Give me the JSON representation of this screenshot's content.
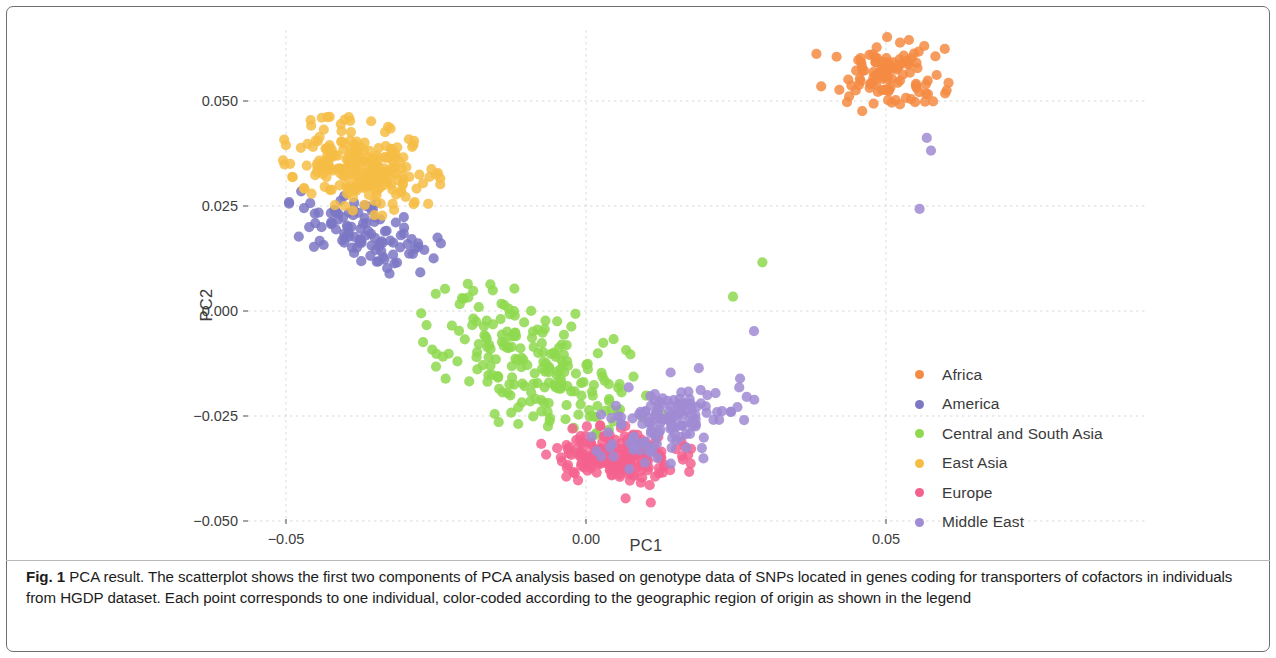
{
  "figure": {
    "caption_bold": "Fig. 1",
    "caption_text": " PCA result. The scatterplot shows the first two components of PCA analysis based on genotype data of SNPs located in genes coding for transporters of cofactors in individuals from HGDP dataset. Each point corresponds to one individual, color-coded according to the geographic region of origin as shown in the legend"
  },
  "chart_data": {
    "type": "scatter",
    "title": "",
    "xlabel": "PC1",
    "ylabel": "PC2",
    "xlim": [
      -0.056,
      0.068
    ],
    "ylim": [
      -0.056,
      0.066
    ],
    "xticks": [
      -0.05,
      0.0,
      0.05
    ],
    "xtick_labels": [
      "−0.05",
      "0.00",
      "0.05"
    ],
    "yticks": [
      0.05,
      0.025,
      0.0,
      -0.025,
      -0.05
    ],
    "ytick_labels": [
      "0.050",
      "0.025",
      "0.000",
      "−0.025",
      "−0.050"
    ],
    "grid": true,
    "grid_color": "#d9d9d9",
    "legend_position": "right",
    "marker_size": 8,
    "marker_opacity": 0.85,
    "series": [
      {
        "name": "Africa",
        "color": "#f58b43",
        "n": 105,
        "center": [
          0.0505,
          0.0555
        ],
        "spread": [
          0.0042,
          0.004
        ],
        "rotation": -0.55,
        "seed": 11
      },
      {
        "name": "America",
        "color": "#7b77c4",
        "n": 105,
        "center": [
          -0.0368,
          0.0185
        ],
        "spread": [
          0.0062,
          0.0036
        ],
        "rotation": -0.62,
        "seed": 23
      },
      {
        "name": "Central and South Asia",
        "color": "#8ed94f",
        "n": 210,
        "center": [
          -0.0075,
          -0.014
        ],
        "spread": [
          0.0105,
          0.0058
        ],
        "rotation": -0.8,
        "seed": 37
      },
      {
        "name": "East Asia",
        "color": "#f6bd45",
        "n": 235,
        "center": [
          -0.0375,
          0.0345
        ],
        "spread": [
          0.006,
          0.0043
        ],
        "rotation": -0.6,
        "seed": 51
      },
      {
        "name": "Europe",
        "color": "#f4618f",
        "n": 185,
        "center": [
          0.0052,
          -0.0345
        ],
        "spread": [
          0.0055,
          0.003
        ],
        "rotation": -0.1,
        "seed": 67
      },
      {
        "name": "Middle East",
        "color": "#a08bd4",
        "n": 145,
        "center": [
          0.0145,
          -0.0258
        ],
        "spread": [
          0.0062,
          0.0044
        ],
        "rotation": 0.62,
        "seed": 83
      }
    ],
    "outliers": [
      {
        "series": "Middle East",
        "x": 0.0568,
        "y": 0.0412
      },
      {
        "series": "Middle East",
        "x": 0.0575,
        "y": 0.0382
      },
      {
        "series": "Middle East",
        "x": 0.0556,
        "y": 0.0243
      },
      {
        "series": "Central and South Asia",
        "x": 0.0294,
        "y": 0.0116
      },
      {
        "series": "Central and South Asia",
        "x": 0.0245,
        "y": 0.0034
      },
      {
        "series": "Middle East",
        "x": 0.028,
        "y": -0.0048
      },
      {
        "series": "Africa",
        "x": 0.0384,
        "y": 0.0612
      },
      {
        "series": "Africa",
        "x": 0.0435,
        "y": 0.0497
      },
      {
        "series": "Africa",
        "x": 0.0392,
        "y": 0.0535
      },
      {
        "series": "Africa",
        "x": 0.0598,
        "y": 0.0624
      },
      {
        "series": "East Asia",
        "x": -0.0402,
        "y": 0.0456
      },
      {
        "series": "East Asia",
        "x": -0.0437,
        "y": 0.0432
      },
      {
        "series": "America",
        "x": -0.047,
        "y": 0.0245
      },
      {
        "series": "America",
        "x": -0.0452,
        "y": 0.0232
      },
      {
        "series": "Central and South Asia",
        "x": -0.0204,
        "y": 0.0029
      },
      {
        "series": "Central and South Asia",
        "x": -0.0188,
        "y": 0.0048
      },
      {
        "series": "Europe",
        "x": 0.0108,
        "y": -0.0456
      },
      {
        "series": "Europe",
        "x": 0.0066,
        "y": -0.0446
      }
    ]
  },
  "legend": {
    "items": [
      {
        "label": "Africa",
        "color": "#f58b43"
      },
      {
        "label": "America",
        "color": "#7b77c4"
      },
      {
        "label": "Central and South Asia",
        "color": "#8ed94f"
      },
      {
        "label": "East Asia",
        "color": "#f6bd45"
      },
      {
        "label": "Europe",
        "color": "#f4618f"
      },
      {
        "label": "Middle East",
        "color": "#a08bd4"
      }
    ]
  }
}
